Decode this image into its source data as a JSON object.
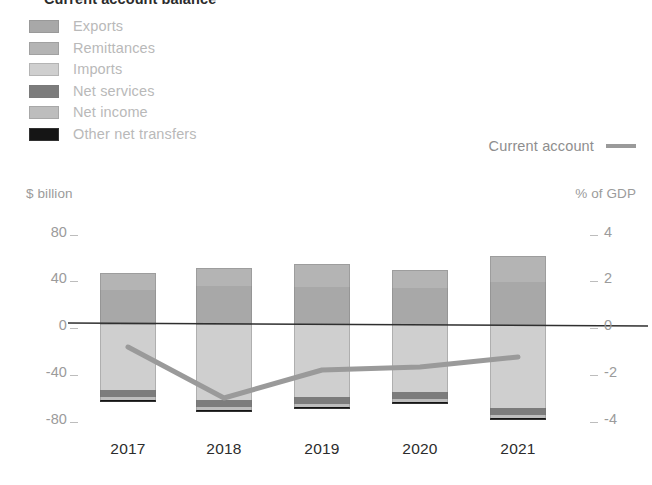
{
  "title": "Current account balance",
  "legend": {
    "items": [
      {
        "label": "Exports",
        "color": "#a8a8a8"
      },
      {
        "label": "Remittances",
        "color": "#b4b4b4"
      },
      {
        "label": "Imports",
        "color": "#cfcfcf"
      },
      {
        "label": "Net services",
        "color": "#7c7c7c"
      },
      {
        "label": "Net income",
        "color": "#bdbdbd"
      },
      {
        "label": "Other net transfers",
        "color": "#151515"
      }
    ],
    "line_series": {
      "label": "Current account",
      "color": "#9a9a9a"
    }
  },
  "axes": {
    "left_unit": "$ billion",
    "right_unit": "% of GDP",
    "left_ticks": [
      "80",
      "40",
      "0",
      "-40",
      "-80"
    ],
    "right_ticks": [
      "4",
      "2",
      "0",
      "-2",
      "-4"
    ]
  },
  "chart_data": {
    "type": "bar",
    "title": "Current account balance",
    "xlabel": "",
    "ylabel": "$ billion",
    "y2label": "% of GDP",
    "ylim": [
      -80,
      80
    ],
    "y2lim": [
      -4,
      4
    ],
    "grid": false,
    "legend_position": "top-left",
    "categories": [
      "2017",
      "2018",
      "2019",
      "2020",
      "2021"
    ],
    "series": [
      {
        "name": "Exports",
        "stack": "positive",
        "color": "#a8a8a8",
        "values": [
          30,
          31,
          32,
          31,
          36
        ]
      },
      {
        "name": "Remittances",
        "stack": "positive",
        "color": "#b4b4b4",
        "values": [
          13,
          14,
          15,
          14,
          15
        ]
      },
      {
        "name": "Imports",
        "stack": "negative",
        "color": "#cfcfcf",
        "values": [
          -55,
          -66,
          -63,
          -58,
          -69
        ]
      },
      {
        "name": "Net services",
        "stack": "negative",
        "color": "#7c7c7c",
        "values": [
          -4,
          -4,
          -4,
          -4,
          -4
        ]
      },
      {
        "name": "Net income",
        "stack": "negative",
        "color": "#bdbdbd",
        "values": [
          -2,
          -2,
          -2,
          -2,
          -2
        ]
      },
      {
        "name": "Other net transfers",
        "stack": "negative",
        "color": "#151515",
        "values": [
          -1,
          -1,
          -1,
          -1,
          -1
        ]
      }
    ],
    "line_series": {
      "name": "Current account",
      "color": "#9a9a9a",
      "axis": "right",
      "unit": "% of GDP",
      "values": [
        -0.9,
        -3.1,
        -1.9,
        -1.8,
        -1.35
      ]
    }
  },
  "geometry": {
    "zero_y": 325,
    "px_per_unit": 1.1875,
    "bar_width": 56,
    "bar_centers": [
      128,
      224,
      322,
      420,
      518
    ],
    "bars": [
      {
        "year": "2017",
        "pos": [
          {
            "c": "#b4b4b4",
            "y0": 273,
            "y1": 290
          },
          {
            "c": "#a8a8a8",
            "y0": 290,
            "y1": 325
          }
        ],
        "neg": [
          {
            "c": "#cfcfcf",
            "y0": 325,
            "y1": 390
          },
          {
            "c": "#7c7c7c",
            "y0": 390,
            "y1": 397
          },
          {
            "c": "#bdbdbd",
            "y0": 397,
            "y1": 400
          },
          {
            "c": "#151515",
            "y0": 400,
            "y1": 402
          }
        ]
      },
      {
        "year": "2018",
        "pos": [
          {
            "c": "#b4b4b4",
            "y0": 268,
            "y1": 286
          },
          {
            "c": "#a8a8a8",
            "y0": 286,
            "y1": 325
          }
        ],
        "neg": [
          {
            "c": "#cfcfcf",
            "y0": 325,
            "y1": 400
          },
          {
            "c": "#7c7c7c",
            "y0": 400,
            "y1": 407
          },
          {
            "c": "#bdbdbd",
            "y0": 407,
            "y1": 410
          },
          {
            "c": "#151515",
            "y0": 410,
            "y1": 412
          }
        ]
      },
      {
        "year": "2019",
        "pos": [
          {
            "c": "#b4b4b4",
            "y0": 264,
            "y1": 287
          },
          {
            "c": "#a8a8a8",
            "y0": 287,
            "y1": 325
          }
        ],
        "neg": [
          {
            "c": "#cfcfcf",
            "y0": 325,
            "y1": 397
          },
          {
            "c": "#7c7c7c",
            "y0": 397,
            "y1": 404
          },
          {
            "c": "#bdbdbd",
            "y0": 404,
            "y1": 407
          },
          {
            "c": "#151515",
            "y0": 407,
            "y1": 409
          }
        ]
      },
      {
        "year": "2020",
        "pos": [
          {
            "c": "#b4b4b4",
            "y0": 270,
            "y1": 288
          },
          {
            "c": "#a8a8a8",
            "y0": 288,
            "y1": 325
          }
        ],
        "neg": [
          {
            "c": "#cfcfcf",
            "y0": 325,
            "y1": 392
          },
          {
            "c": "#7c7c7c",
            "y0": 392,
            "y1": 399
          },
          {
            "c": "#bdbdbd",
            "y0": 399,
            "y1": 402
          },
          {
            "c": "#151515",
            "y0": 402,
            "y1": 404
          }
        ]
      },
      {
        "year": "2021",
        "pos": [
          {
            "c": "#b4b4b4",
            "y0": 256,
            "y1": 282
          },
          {
            "c": "#a8a8a8",
            "y0": 282,
            "y1": 325
          }
        ],
        "neg": [
          {
            "c": "#cfcfcf",
            "y0": 325,
            "y1": 408
          },
          {
            "c": "#7c7c7c",
            "y0": 408,
            "y1": 415
          },
          {
            "c": "#bdbdbd",
            "y0": 415,
            "y1": 418
          },
          {
            "c": "#151515",
            "y0": 418,
            "y1": 420
          }
        ]
      }
    ],
    "line_points": [
      [
        128,
        347
      ],
      [
        224,
        398
      ],
      [
        322,
        370
      ],
      [
        420,
        367
      ],
      [
        518,
        357
      ]
    ],
    "tick_rows": [
      {
        "y": 232,
        "left": "80",
        "right": "4"
      },
      {
        "y": 278,
        "left": "40",
        "right": "2"
      },
      {
        "y": 325,
        "left": "0",
        "right": "0"
      },
      {
        "y": 372,
        "left": "-40",
        "right": "-2"
      },
      {
        "y": 419,
        "left": "-80",
        "right": "-4"
      }
    ]
  }
}
